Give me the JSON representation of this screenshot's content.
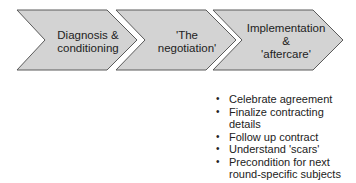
{
  "diagram": {
    "stages": [
      {
        "id": "stage-1",
        "lines": [
          "Diagnosis &",
          "conditioning"
        ]
      },
      {
        "id": "stage-2",
        "lines": [
          "'The",
          "negotiation'"
        ]
      },
      {
        "id": "stage-3",
        "lines": [
          "Implementation",
          "&",
          "'aftercare'"
        ]
      }
    ],
    "stage3_details": [
      "Celebrate agreement",
      "Finalize contracting details",
      "Follow up contract",
      "Understand 'scars'",
      "Precondition for next round-specific subjects"
    ],
    "colors": {
      "fill": "#d3d3d3",
      "stroke": "#5a5a5a",
      "text": "#222222"
    }
  }
}
